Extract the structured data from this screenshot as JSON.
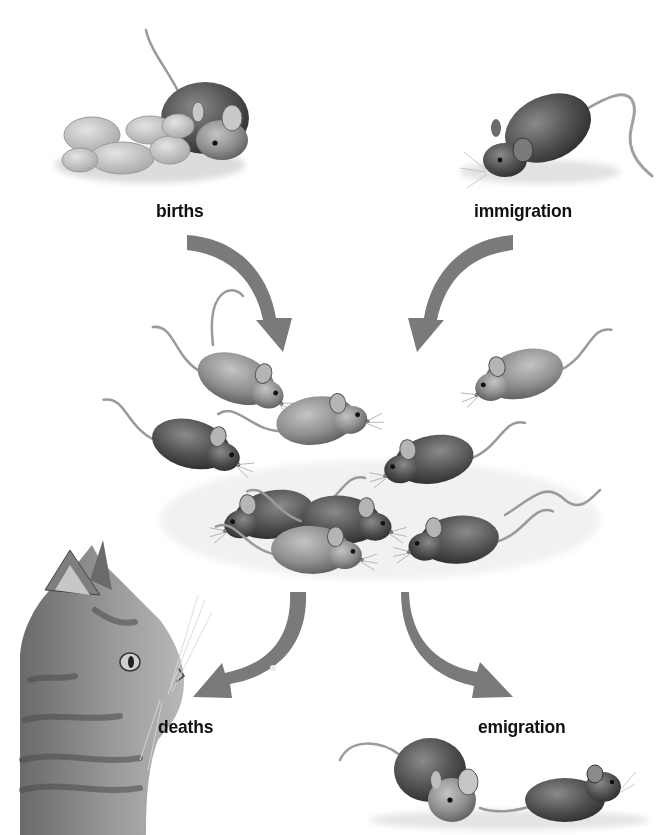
{
  "diagram": {
    "center": {
      "name": "mouse population",
      "mouse_count": 9
    },
    "inputs": [
      {
        "id": "births",
        "label": "births",
        "direction": "in",
        "illustration": "mother mouse with newborn pups"
      },
      {
        "id": "immigration",
        "label": "immigration",
        "direction": "in",
        "illustration": "dark mouse arriving"
      }
    ],
    "outputs": [
      {
        "id": "deaths",
        "label": "deaths",
        "direction": "out",
        "illustration": "cat (predator)"
      },
      {
        "id": "emigration",
        "label": "emigration",
        "direction": "out",
        "illustration": "two mice leaving"
      }
    ]
  },
  "colors": {
    "background": "#ffffff",
    "arrow": "#7a7a7a",
    "label_text": "#111111",
    "mouse_light": "#9a9a9a",
    "mouse_dark": "#555555"
  }
}
